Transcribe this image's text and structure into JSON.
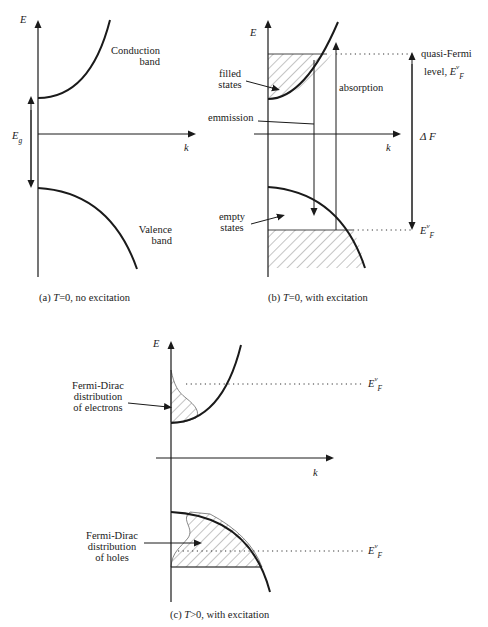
{
  "panel_a": {
    "axis_e": "E",
    "axis_k": "k",
    "gap_label": "E",
    "gap_sub": "g",
    "conduction_1": "Conduction",
    "conduction_2": "band",
    "valence_1": "Valence",
    "valence_2": "band",
    "caption_pre": "(a) ",
    "caption_t": "T",
    "caption_post": "=0, no excitation"
  },
  "panel_b": {
    "axis_e": "E",
    "axis_k": "k",
    "filled_1": "filled",
    "filled_2": "states",
    "empty_1": "empty",
    "empty_2": "states",
    "emission": "emmission",
    "absorption": "absorption",
    "quasi_1": "quasi-Fermi",
    "quasi_2": "level, ",
    "ef_E": "E",
    "ef_sup": "v",
    "ef_sub": "F",
    "delta_f": "Δ F",
    "caption_pre": "(b) ",
    "caption_t": "T",
    "caption_post": "=0, with excitation"
  },
  "panel_c": {
    "axis_e": "E",
    "axis_k": "k",
    "fd_e_1": "Fermi-Dirac",
    "fd_e_2": "distribution",
    "fd_e_3": "of electrons",
    "fd_h_1": "Fermi-Dirac",
    "fd_h_2": "distribution",
    "fd_h_3": "of holes",
    "ef_E": "E",
    "ef_sup": "v",
    "ef_sub": "F",
    "caption_pre": "(c) ",
    "caption_t": "T",
    "caption_post": ">0, with excitation"
  }
}
